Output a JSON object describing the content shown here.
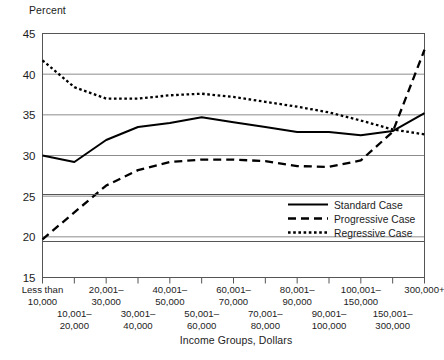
{
  "chart_data": {
    "type": "line",
    "title": "",
    "ylabel": "Percent",
    "xlabel": "Income Groups, Dollars",
    "ylim": [
      15,
      45
    ],
    "yticks": [
      15,
      20,
      25,
      30,
      35,
      40,
      45
    ],
    "grid": true,
    "legend_position": "bottom-right",
    "categories": [
      "Less than 10,000",
      "10,001– 20,000",
      "20,001– 30,000",
      "30,001– 40,000",
      "40,001– 50,000",
      "50,001– 60,000",
      "60,001– 70,000",
      "70,001– 80,000",
      "80,001– 90,000",
      "90,001– 100,000",
      "100,001– 150,000",
      "150,001– 300,000",
      "300,000+"
    ],
    "series": [
      {
        "name": "Standard Case",
        "style": "solid",
        "values": [
          30.0,
          29.2,
          31.9,
          33.5,
          34.0,
          34.7,
          34.1,
          33.5,
          32.9,
          32.9,
          32.5,
          33.0,
          35.2
        ]
      },
      {
        "name": "Progressive Case",
        "style": "dashed",
        "values": [
          19.7,
          23.0,
          26.3,
          28.2,
          29.2,
          29.5,
          29.5,
          29.3,
          28.7,
          28.6,
          29.4,
          32.9,
          43.0
        ]
      },
      {
        "name": "Regressive Case",
        "style": "dotted",
        "values": [
          41.7,
          38.4,
          37.0,
          37.0,
          37.4,
          37.6,
          37.2,
          36.6,
          36.0,
          35.3,
          34.3,
          33.2,
          32.6
        ]
      }
    ]
  },
  "axis": {
    "y_title": "Percent",
    "x_title": "Income Groups, Dollars",
    "ytick_labels": [
      "45",
      "40",
      "35",
      "30",
      "25",
      "20",
      "15"
    ]
  },
  "xlabels_row_upper": [
    {
      "line1": "Less than",
      "line2": "10,000"
    },
    {
      "line1": "20,001–",
      "line2": "30,000"
    },
    {
      "line1": "40,001–",
      "line2": "50,000"
    },
    {
      "line1": "60,001–",
      "line2": "70,000"
    },
    {
      "line1": "80,001–",
      "line2": "90,000"
    },
    {
      "line1": "100,001–",
      "line2": "150,000"
    },
    {
      "line1": "300,000+",
      "line2": ""
    }
  ],
  "xlabels_row_lower": [
    {
      "line1": "10,001–",
      "line2": "20,000"
    },
    {
      "line1": "30,001–",
      "line2": "40,000"
    },
    {
      "line1": "50,001–",
      "line2": "60,000"
    },
    {
      "line1": "70,001–",
      "line2": "80,000"
    },
    {
      "line1": "90,001–",
      "line2": "100,000"
    },
    {
      "line1": "150,001–",
      "line2": "300,000"
    }
  ],
  "legend": {
    "items": [
      {
        "label": "Standard Case",
        "style": "solid"
      },
      {
        "label": "Progressive Case",
        "style": "dashed"
      },
      {
        "label": "Regressive Case",
        "style": "dotted"
      }
    ]
  },
  "colors": {
    "line": "#000000",
    "grid": "#8c8c8c",
    "frame": "#555555",
    "text": "#1c1c1c",
    "background": "#ffffff"
  }
}
